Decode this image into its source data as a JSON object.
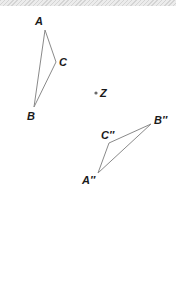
{
  "figure": {
    "type": "geometry-transformation",
    "center_label": "Z",
    "original_triangle": {
      "vertices": [
        {
          "name": "A",
          "label": "A",
          "x": 45,
          "y": 30
        },
        {
          "name": "C",
          "label": "C",
          "x": 56,
          "y": 62
        },
        {
          "name": "B",
          "label": "B",
          "x": 34,
          "y": 107
        }
      ]
    },
    "image_triangle": {
      "vertices": [
        {
          "name": "B''",
          "label": "B″",
          "x": 151,
          "y": 124
        },
        {
          "name": "C''",
          "label": "C″",
          "x": 109,
          "y": 143
        },
        {
          "name": "A''",
          "label": "A″",
          "x": 98,
          "y": 173
        }
      ]
    },
    "center_point": {
      "label": "Z",
      "x": 96,
      "y": 93
    },
    "colors": {
      "line": "#8a8a8a",
      "text": "#1a1a1a",
      "point": "#6a6a6a"
    }
  }
}
